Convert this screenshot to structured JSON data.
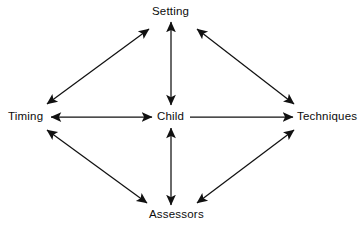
{
  "diagram": {
    "background_color": "#ffffff",
    "stroke_color": "#111111",
    "text_color": "#0c0c0c",
    "nodes": [
      {
        "id": "setting",
        "label": "Setting",
        "position": "top",
        "x": 171,
        "y": 11
      },
      {
        "id": "timing",
        "label": "Timing",
        "position": "left",
        "x": 27,
        "y": 116
      },
      {
        "id": "child",
        "label": "Child",
        "position": "center",
        "x": 171,
        "y": 116
      },
      {
        "id": "techniques",
        "label": "Techniques",
        "position": "right",
        "x": 325,
        "y": 116
      },
      {
        "id": "assessors",
        "label": "Assessors",
        "position": "bottom",
        "x": 171,
        "y": 214
      }
    ],
    "edges": [
      {
        "from": "timing",
        "to": "setting",
        "arrows": "both",
        "style": "diagonal"
      },
      {
        "from": "setting",
        "to": "techniques",
        "arrows": "both",
        "style": "diagonal"
      },
      {
        "from": "timing",
        "to": "assessors",
        "arrows": "both",
        "style": "diagonal"
      },
      {
        "from": "assessors",
        "to": "techniques",
        "arrows": "both",
        "style": "diagonal"
      },
      {
        "from": "child",
        "to": "setting",
        "arrows": "both",
        "style": "vertical"
      },
      {
        "from": "child",
        "to": "assessors",
        "arrows": "both",
        "style": "vertical"
      },
      {
        "from": "timing",
        "to": "child",
        "arrows": "both",
        "style": "horizontal"
      },
      {
        "from": "child",
        "to": "techniques",
        "arrows": "end",
        "style": "horizontal"
      }
    ]
  }
}
